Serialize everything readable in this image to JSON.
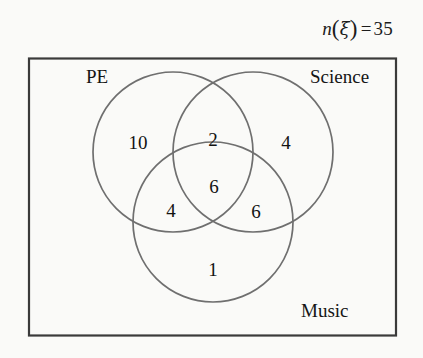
{
  "diagram": {
    "type": "venn3",
    "universe_label": {
      "function": "n",
      "argument": "ξ",
      "equals": "=",
      "value": "35",
      "full_text": "n(ξ) = 35"
    },
    "sets": [
      {
        "name": "PE",
        "label": "PE"
      },
      {
        "name": "Science",
        "label": "Science"
      },
      {
        "name": "Music",
        "label": "Music"
      }
    ],
    "regions": [
      {
        "name": "pe-only",
        "label": "10",
        "sets": [
          "PE"
        ]
      },
      {
        "name": "pe-science",
        "label": "2",
        "sets": [
          "PE",
          "Science"
        ]
      },
      {
        "name": "science-only",
        "label": "4",
        "sets": [
          "Science"
        ]
      },
      {
        "name": "pe-music",
        "label": "4",
        "sets": [
          "PE",
          "Music"
        ]
      },
      {
        "name": "all-three",
        "label": "6",
        "sets": [
          "PE",
          "Science",
          "Music"
        ]
      },
      {
        "name": "science-music",
        "label": "6",
        "sets": [
          "Science",
          "Music"
        ]
      },
      {
        "name": "music-only",
        "label": "1",
        "sets": [
          "Music"
        ]
      }
    ],
    "colors": {
      "background": "#fafaf8",
      "rectangle_stroke": "#3a3a3a",
      "circle_stroke": "#6f6f6f",
      "text": "#141414"
    }
  }
}
